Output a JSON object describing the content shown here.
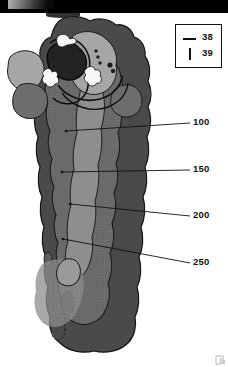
{
  "figure": {
    "type": "grayscale-anatomical-section-map",
    "top_bar": {
      "present": true,
      "color": "#000000"
    },
    "background": "#ffffff"
  },
  "legend": {
    "box_label": "scale-legend",
    "entries": [
      {
        "symbol": "horizontal-bar",
        "label": "38"
      },
      {
        "symbol": "vertical-bar",
        "label": "39"
      }
    ]
  },
  "callouts": [
    {
      "label": "100",
      "x": 193,
      "y": 120,
      "anchor_x": 66,
      "anchor_y": 131
    },
    {
      "label": "150",
      "x": 193,
      "y": 167,
      "anchor_x": 62,
      "anchor_y": 172
    },
    {
      "label": "200",
      "x": 193,
      "y": 213,
      "anchor_x": 70,
      "anchor_y": 204
    },
    {
      "label": "250",
      "x": 193,
      "y": 260,
      "anchor_x": 63,
      "anchor_y": 239
    }
  ],
  "colors": {
    "ink": "#111111",
    "dark_gray": "#4a4a4a",
    "mid_gray": "#6d6d6d",
    "light_gray": "#8e8e8e",
    "pale_gray": "#a6a6a6",
    "near_black": "#232323",
    "white_feature": "#f7f7f7",
    "outline": "#111111"
  },
  "regions": [
    {
      "name": "outer-cortical-band",
      "tone": "dark_gray"
    },
    {
      "name": "inner-medullary-band",
      "tone": "mid_gray"
    },
    {
      "name": "central-core",
      "tone": "light_gray"
    },
    {
      "name": "upper-lobe",
      "tone": "pale_gray"
    },
    {
      "name": "dark-nucleus",
      "tone": "near_black"
    },
    {
      "name": "white-cleft-features",
      "tone": "white_feature"
    }
  ],
  "corner_mark": {
    "present": true
  }
}
